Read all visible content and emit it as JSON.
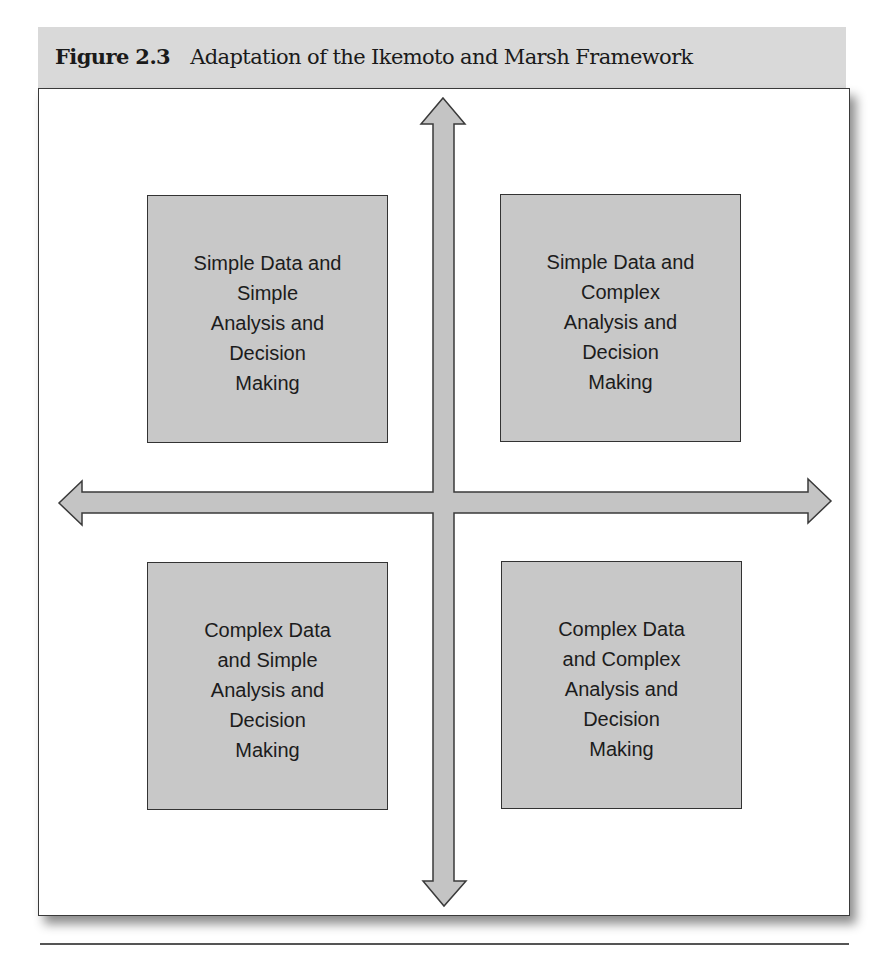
{
  "figure": {
    "number_label": "Figure 2.3",
    "title": "Adaptation of the Ikemoto and Marsh Framework"
  },
  "quadrants": {
    "top_left": {
      "lines": [
        "Simple Data and",
        "Simple",
        "Analysis and",
        "Decision",
        "Making"
      ]
    },
    "top_right": {
      "lines": [
        "Simple Data and",
        "Complex",
        "Analysis and",
        "Decision",
        "Making"
      ]
    },
    "bottom_left": {
      "lines": [
        "Complex Data",
        "and Simple",
        "Analysis and",
        "Decision",
        "Making"
      ]
    },
    "bottom_right": {
      "lines": [
        "Complex Data",
        "and Complex",
        "Analysis and",
        "Decision",
        "Making"
      ]
    }
  },
  "axes": {
    "vertical_arrow": "double-headed-vertical-arrow",
    "horizontal_arrow": "double-headed-horizontal-arrow"
  },
  "colors": {
    "banner_bg": "#d9d9d9",
    "box_fill": "#c8c8c8",
    "arrow_fill": "#c4c4c4",
    "stroke": "#333333"
  }
}
